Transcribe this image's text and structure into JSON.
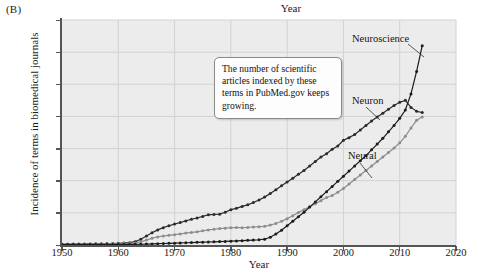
{
  "figure": {
    "panel_letter": "(B)",
    "top_title": "Year"
  },
  "callout": {
    "text": "The number of scientific articles indexed by these terms in PubMed.gov keeps growing."
  },
  "series_labels": {
    "neuroscience": "Neuroscience",
    "neuron": "Neuron",
    "neural": "Neural"
  },
  "colors": {
    "neuroscience": "#1c1c1c",
    "neuron": "#2b2b2b",
    "neural": "#8d8d8d",
    "plot_background": "#ececec",
    "gridline": "#d2d2d2",
    "axis": "#555555"
  },
  "chart_data": {
    "type": "line",
    "title": "Year",
    "xlabel": "Year",
    "ylabel": "Incidence of terms in biomedical journals",
    "xlim": [
      1950,
      2020
    ],
    "ylim": [
      0,
      35000
    ],
    "xticks": [
      1950,
      1960,
      1970,
      1980,
      1990,
      2000,
      2010,
      2020
    ],
    "xtick_labels": [
      "1950",
      "1960",
      "1970",
      "1980",
      "1990",
      "2000",
      "2010",
      "2020"
    ],
    "yticks": [
      0,
      5000,
      10000,
      15000,
      20000,
      25000,
      30000,
      35000
    ],
    "ytick_labels": [
      "0",
      "5,000",
      "10,000",
      "15,000",
      "20,000",
      "25,000",
      "30,000",
      "35,000"
    ],
    "grid": true,
    "legend": "inline-annotations",
    "annotations": [
      {
        "text": "Neuroscience",
        "x": 2003,
        "y": 31200
      },
      {
        "text": "Neuron",
        "x": 2002,
        "y": 21600
      },
      {
        "text": "Neural",
        "x": 2001,
        "y": 13400
      },
      {
        "text": "The number of scientific articles indexed by these terms in PubMed.gov keeps growing.",
        "x": 1978,
        "y": 28000
      }
    ],
    "x": [
      1950,
      1951,
      1952,
      1953,
      1954,
      1955,
      1956,
      1957,
      1958,
      1959,
      1960,
      1961,
      1962,
      1963,
      1964,
      1965,
      1966,
      1967,
      1968,
      1969,
      1970,
      1971,
      1972,
      1973,
      1974,
      1975,
      1976,
      1977,
      1978,
      1979,
      1980,
      1981,
      1982,
      1983,
      1984,
      1985,
      1986,
      1987,
      1988,
      1989,
      1990,
      1991,
      1992,
      1993,
      1994,
      1995,
      1996,
      1997,
      1998,
      1999,
      2000,
      2001,
      2002,
      2003,
      2004,
      2005,
      2006,
      2007,
      2008,
      2009,
      2010,
      2011,
      2012,
      2013,
      2014
    ],
    "series": [
      {
        "name": "Neuron",
        "color": "#2b2b2b",
        "values": [
          120,
          130,
          140,
          150,
          160,
          170,
          185,
          200,
          215,
          230,
          260,
          300,
          360,
          520,
          900,
          1400,
          1900,
          2350,
          2700,
          3000,
          3250,
          3500,
          3750,
          4000,
          4200,
          4450,
          4700,
          4750,
          4800,
          5100,
          5500,
          5700,
          6000,
          6250,
          6600,
          7000,
          7450,
          8000,
          8600,
          9200,
          9800,
          10400,
          11000,
          11600,
          12300,
          13000,
          13700,
          14200,
          14900,
          15400,
          16300,
          16700,
          17200,
          17900,
          18600,
          19300,
          19900,
          20500,
          21100,
          21700,
          22200,
          22500,
          21400,
          20800,
          20600
        ]
      },
      {
        "name": "Neural",
        "color": "#8d8d8d",
        "values": [
          110,
          115,
          120,
          125,
          130,
          140,
          150,
          160,
          170,
          180,
          195,
          215,
          250,
          330,
          480,
          760,
          1050,
          1250,
          1400,
          1500,
          1600,
          1720,
          1850,
          1950,
          2050,
          2200,
          2350,
          2450,
          2550,
          2620,
          2700,
          2720,
          2700,
          2730,
          2800,
          2850,
          2900,
          3100,
          3350,
          3700,
          4100,
          4550,
          5050,
          5500,
          5950,
          6400,
          6900,
          7400,
          7700,
          8200,
          8800,
          9500,
          10200,
          10900,
          11600,
          12300,
          13000,
          13700,
          14400,
          15100,
          15900,
          16900,
          18200,
          19400,
          19900
        ]
      },
      {
        "name": "Neuroscience",
        "color": "#1c1c1c",
        "values": [
          60,
          62,
          64,
          66,
          68,
          70,
          72,
          75,
          78,
          80,
          85,
          90,
          95,
          105,
          120,
          140,
          170,
          200,
          230,
          260,
          290,
          320,
          350,
          380,
          410,
          440,
          470,
          500,
          530,
          560,
          600,
          640,
          680,
          720,
          760,
          820,
          900,
          1200,
          1700,
          2300,
          3000,
          3700,
          4400,
          5100,
          5900,
          6700,
          7500,
          8300,
          9100,
          9900,
          10700,
          11500,
          12300,
          13100,
          13900,
          14800,
          15700,
          16600,
          17600,
          18600,
          19700,
          21000,
          23500,
          27000,
          31000
        ]
      }
    ]
  }
}
